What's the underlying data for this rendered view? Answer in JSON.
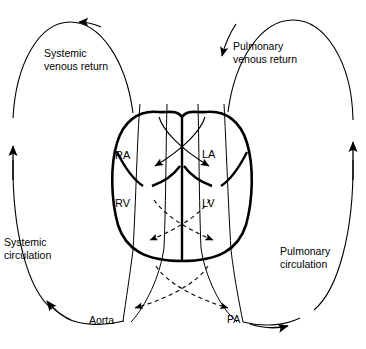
{
  "diagram": {
    "stroke_color": "#000000",
    "background_color": "#ffffff",
    "labels": {
      "systemic_venous_return_line1": "Systemic",
      "systemic_venous_return_line2": "venous return",
      "pulmonary_venous_return_line1": "Pulmonary",
      "pulmonary_venous_return_line2": "venous return",
      "systemic_circulation_line1": "Systemic",
      "systemic_circulation_line2": "circulation",
      "pulmonary_circulation_line1": "Pulmonary",
      "pulmonary_circulation_line2": "circulation",
      "right_atrium": "RA",
      "left_atrium": "LA",
      "right_ventricle": "RV",
      "left_ventricle": "LV",
      "aorta": "Aorta",
      "pulmonary_artery": "PA"
    }
  }
}
